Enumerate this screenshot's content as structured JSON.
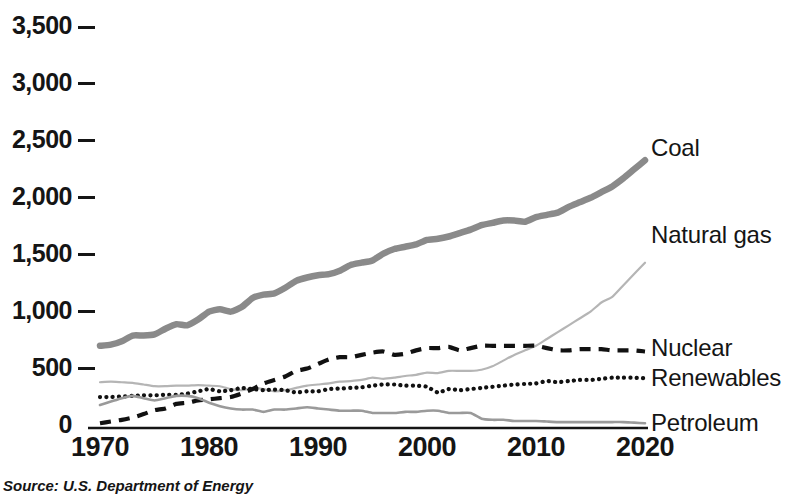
{
  "source_note": "Source: U.S. Department of Energy",
  "axis": {
    "y_ticks": [
      "3,500",
      "3,000",
      "2,500",
      "2,000",
      "1,500",
      "1,000",
      "500",
      "0"
    ],
    "x_ticks": [
      "1970",
      "1980",
      "1990",
      "2000",
      "2010",
      "2020"
    ]
  },
  "series_labels": {
    "coal": "Coal",
    "natural_gas": "Natural gas",
    "nuclear": "Nuclear",
    "renewables": "Renewables",
    "petroleum": "Petroleum"
  },
  "colors": {
    "coal": "#8a8a8a",
    "natural_gas": "#b5b5b5",
    "nuclear": "#111111",
    "renewables": "#111111",
    "petroleum": "#9a9a9a",
    "text": "#151515",
    "background": "#ffffff"
  },
  "chart_data": {
    "type": "line",
    "title": "",
    "subtitle": "",
    "xlabel": "",
    "ylabel": "",
    "xlim": [
      1970,
      2020
    ],
    "ylim": [
      0,
      3500
    ],
    "y_tick_values": [
      0,
      500,
      1000,
      1500,
      2000,
      2500,
      3000,
      3500
    ],
    "x_tick_values": [
      1970,
      1980,
      1990,
      2000,
      2010,
      2020
    ],
    "grid": false,
    "legend_position": "right-inline",
    "annotation": "Source: U.S. Department of Energy",
    "x": [
      1970,
      1971,
      1972,
      1973,
      1974,
      1975,
      1976,
      1977,
      1978,
      1979,
      1980,
      1981,
      1982,
      1983,
      1984,
      1985,
      1986,
      1987,
      1988,
      1989,
      1990,
      1991,
      1992,
      1993,
      1994,
      1995,
      1996,
      1997,
      1998,
      1999,
      2000,
      2001,
      2002,
      2003,
      2004,
      2005,
      2006,
      2007,
      2008,
      2009,
      2010,
      2011,
      2012,
      2013,
      2014,
      2015,
      2016,
      2017,
      2018,
      2019,
      2020
    ],
    "series": [
      {
        "name": "Coal",
        "style": "thick-solid",
        "color": "#8a8a8a",
        "values": [
          700,
          710,
          740,
          790,
          790,
          800,
          850,
          890,
          880,
          930,
          1000,
          1020,
          1000,
          1040,
          1120,
          1150,
          1160,
          1210,
          1270,
          1300,
          1320,
          1330,
          1360,
          1410,
          1430,
          1450,
          1510,
          1550,
          1570,
          1590,
          1630,
          1640,
          1660,
          1690,
          1720,
          1760,
          1780,
          1800,
          1800,
          1790,
          1830,
          1850,
          1870,
          1920,
          1960,
          2000,
          2050,
          2100,
          2170,
          2250,
          2330
        ]
      },
      {
        "name": "Natural gas",
        "style": "thin-solid",
        "color": "#b5b5b5",
        "values": [
          380,
          385,
          380,
          375,
          360,
          345,
          345,
          350,
          350,
          355,
          350,
          345,
          320,
          310,
          330,
          320,
          300,
          310,
          330,
          350,
          360,
          370,
          385,
          390,
          400,
          420,
          410,
          420,
          435,
          445,
          465,
          460,
          480,
          480,
          480,
          490,
          520,
          570,
          620,
          660,
          700,
          760,
          820,
          880,
          940,
          1000,
          1080,
          1130,
          1230,
          1330,
          1430
        ]
      },
      {
        "name": "Nuclear",
        "style": "dashed",
        "color": "#111111",
        "values": [
          20,
          35,
          50,
          70,
          100,
          135,
          150,
          190,
          200,
          220,
          230,
          240,
          250,
          280,
          320,
          370,
          400,
          430,
          480,
          500,
          540,
          580,
          600,
          600,
          620,
          640,
          650,
          620,
          630,
          660,
          680,
          680,
          690,
          660,
          680,
          700,
          700,
          700,
          700,
          700,
          700,
          680,
          660,
          660,
          670,
          670,
          670,
          660,
          660,
          660,
          650
        ]
      },
      {
        "name": "Renewables",
        "style": "dotted",
        "color": "#111111",
        "values": [
          250,
          250,
          255,
          260,
          265,
          265,
          270,
          270,
          280,
          300,
          320,
          300,
          310,
          330,
          320,
          310,
          315,
          310,
          290,
          300,
          300,
          320,
          325,
          330,
          335,
          350,
          360,
          360,
          350,
          350,
          340,
          290,
          320,
          310,
          320,
          330,
          340,
          350,
          360,
          365,
          370,
          390,
          380,
          390,
          400,
          400,
          410,
          420,
          420,
          420,
          415
        ]
      },
      {
        "name": "Petroleum",
        "style": "thin-solid-dark",
        "color": "#9a9a9a",
        "values": [
          180,
          210,
          240,
          260,
          240,
          220,
          240,
          260,
          260,
          240,
          200,
          170,
          150,
          140,
          140,
          120,
          140,
          140,
          150,
          160,
          150,
          140,
          130,
          130,
          130,
          110,
          110,
          110,
          120,
          120,
          130,
          130,
          110,
          110,
          110,
          60,
          50,
          50,
          40,
          40,
          40,
          35,
          30,
          30,
          30,
          30,
          30,
          30,
          30,
          25,
          20
        ]
      }
    ]
  }
}
